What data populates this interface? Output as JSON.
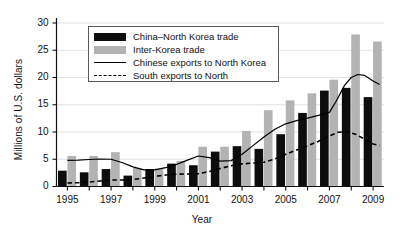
{
  "chart_data": {
    "type": "bar",
    "title": "",
    "xlabel": "Year",
    "ylabel": "Millions of U.S. dollars",
    "xlim": [
      1994.5,
      2009.5
    ],
    "ylim": [
      0,
      30
    ],
    "grid": true,
    "grid_axis": "y",
    "legend_position": "upper-left-inside",
    "categories": [
      1995,
      1996,
      1997,
      1998,
      1999,
      2000,
      2001,
      2002,
      2003,
      2004,
      2005,
      2006,
      2007,
      2008,
      2009
    ],
    "xtick_labels": [
      "1995",
      "1997",
      "1999",
      "2001",
      "2003",
      "2005",
      "2007",
      "2009"
    ],
    "xtick_values": [
      1995,
      1997,
      1999,
      2001,
      2003,
      2005,
      2007,
      2009
    ],
    "ytick_labels": [
      "0",
      "5",
      "10",
      "15",
      "20",
      "25",
      "30"
    ],
    "ytick_values": [
      0,
      5,
      10,
      15,
      20,
      25,
      30
    ],
    "series": [
      {
        "name": "China–North Korea trade",
        "type": "bar",
        "color": "#0d0d0d",
        "values": [
          2.9,
          2.6,
          3.2,
          2.0,
          3.2,
          4.2,
          3.9,
          6.4,
          7.4,
          6.9,
          9.6,
          13.5,
          17.6,
          18.1,
          16.4
        ]
      },
      {
        "name": "Inter-Korea trade",
        "type": "bar",
        "color": "#b3b3b3",
        "values": [
          5.6,
          5.6,
          6.3,
          3.4,
          3.3,
          4.7,
          7.3,
          7.3,
          10.2,
          14.0,
          15.8,
          17.1,
          19.6,
          27.9,
          26.6
        ]
      },
      {
        "name": "Chinese exports to North Korea",
        "type": "line",
        "style": "solid",
        "color": "#000000",
        "values": [
          4.8,
          4.9,
          5.0,
          3.5,
          3.0,
          3.3,
          4.5,
          5.6,
          4.8,
          5.5,
          7.2,
          9.6,
          11.6,
          12.3,
          13.4
        ]
      },
      {
        "name": "South exports to North",
        "type": "line",
        "style": "dashed",
        "color": "#000000",
        "values": [
          0.65,
          0.85,
          1.15,
          1.2,
          1.6,
          2.2,
          2.3,
          2.6,
          3.4,
          4.2,
          4.4,
          5.2,
          6.3,
          7.4,
          8.5
        ]
      }
    ],
    "line_curves": [
      {
        "name": "Chinese exports to North Korea",
        "style": "solid",
        "points": [
          [
            1995.0,
            4.8
          ],
          [
            1995.5,
            4.85
          ],
          [
            1996.0,
            4.95
          ],
          [
            1996.5,
            5.05
          ],
          [
            1997.0,
            5.0
          ],
          [
            1997.5,
            4.4
          ],
          [
            1998.0,
            3.6
          ],
          [
            1998.5,
            3.05
          ],
          [
            1999.0,
            3.05
          ],
          [
            1999.5,
            3.45
          ],
          [
            2000.0,
            4.05
          ],
          [
            2000.5,
            4.85
          ],
          [
            2001.0,
            5.6
          ],
          [
            2001.5,
            5.3
          ],
          [
            2002.0,
            4.65
          ],
          [
            2002.5,
            4.75
          ],
          [
            2003.0,
            5.9
          ],
          [
            2003.5,
            7.5
          ],
          [
            2004.0,
            9.1
          ],
          [
            2004.5,
            10.5
          ],
          [
            2005.0,
            11.5
          ],
          [
            2005.5,
            12.1
          ],
          [
            2006.0,
            12.55
          ],
          [
            2006.5,
            13.05
          ],
          [
            2007.0,
            13.6
          ],
          [
            2007.3,
            15.6
          ],
          [
            2007.7,
            18.6
          ],
          [
            2008.0,
            20.0
          ],
          [
            2008.3,
            20.55
          ],
          [
            2008.6,
            20.4
          ],
          [
            2009.0,
            19.35
          ],
          [
            2009.3,
            18.7
          ]
        ]
      },
      {
        "name": "South exports to North",
        "style": "dashed",
        "points": [
          [
            1995.0,
            0.65
          ],
          [
            1995.5,
            0.7
          ],
          [
            1996.0,
            0.82
          ],
          [
            1996.5,
            1.0
          ],
          [
            1997.0,
            1.18
          ],
          [
            1997.5,
            1.2
          ],
          [
            1998.0,
            1.28
          ],
          [
            1998.5,
            1.55
          ],
          [
            1999.0,
            1.85
          ],
          [
            1999.5,
            2.1
          ],
          [
            2000.0,
            2.25
          ],
          [
            2000.5,
            2.3
          ],
          [
            2001.0,
            2.35
          ],
          [
            2001.5,
            2.75
          ],
          [
            2002.0,
            3.3
          ],
          [
            2002.5,
            3.8
          ],
          [
            2003.0,
            4.15
          ],
          [
            2003.5,
            4.3
          ],
          [
            2004.0,
            4.45
          ],
          [
            2004.5,
            5.05
          ],
          [
            2005.0,
            5.9
          ],
          [
            2005.5,
            6.7
          ],
          [
            2006.0,
            7.45
          ],
          [
            2006.5,
            8.3
          ],
          [
            2007.0,
            9.3
          ],
          [
            2007.4,
            9.95
          ],
          [
            2007.8,
            10.05
          ],
          [
            2008.2,
            9.6
          ],
          [
            2008.6,
            8.7
          ],
          [
            2009.0,
            7.8
          ],
          [
            2009.3,
            7.55
          ]
        ]
      }
    ],
    "legend": {
      "entries": [
        {
          "label": "China–North Korea trade",
          "key": "black-swatch"
        },
        {
          "label": "Inter-Korea trade",
          "key": "gray-swatch"
        },
        {
          "label": "Chinese exports to North Korea",
          "key": "solid-line"
        },
        {
          "label": "South exports to North",
          "key": "dashed-line"
        }
      ]
    }
  }
}
